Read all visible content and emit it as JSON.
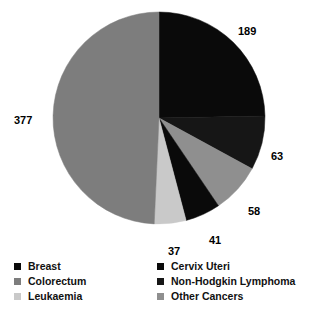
{
  "chart_data": {
    "type": "pie",
    "title": "",
    "subtitle": "",
    "xlabel": "",
    "ylabel": "",
    "legend_position": "bottom",
    "grid": false,
    "total": 765,
    "start_angle_deg": 0,
    "direction": "clockwise",
    "categories": [
      "Breast",
      "Non-Hodgkin Lymphoma",
      "Other Cancers",
      "Cervix Uteri",
      "Leukaemia",
      "Colorectum"
    ],
    "values": [
      189,
      63,
      58,
      41,
      37,
      377
    ],
    "slices": [
      {
        "label": "Breast",
        "value": 189,
        "value_text": "189",
        "color": "#0a0a0a"
      },
      {
        "label": "Non-Hodgkin Lymphoma",
        "value": 63,
        "value_text": "63",
        "color": "#161616"
      },
      {
        "label": "Other Cancers",
        "value": 58,
        "value_text": "58",
        "color": "#8f8f8f"
      },
      {
        "label": "Cervix Uteri",
        "value": 41,
        "value_text": "41",
        "color": "#0a0a0a"
      },
      {
        "label": "Leukaemia",
        "value": 37,
        "value_text": "37",
        "color": "#c9c9c9"
      },
      {
        "label": "Colorectum",
        "value": 377,
        "value_text": "377",
        "color": "#7d7d7d"
      }
    ],
    "data_labels": [
      {
        "name": "breast",
        "text": "189",
        "x": 238,
        "y": 25
      },
      {
        "name": "non-hodgkin-lymphoma",
        "text": "63",
        "x": 271,
        "y": 150
      },
      {
        "name": "other-cancers",
        "text": "58",
        "x": 248,
        "y": 205
      },
      {
        "name": "cervix-uteri",
        "text": "41",
        "x": 209,
        "y": 234
      },
      {
        "name": "leukaemia",
        "text": "37",
        "x": 168,
        "y": 245
      },
      {
        "name": "colorectum",
        "text": "377",
        "x": 14,
        "y": 114
      }
    ]
  },
  "legend": {
    "left_column": [
      {
        "label": "Breast",
        "color": "#0a0a0a"
      },
      {
        "label": "Colorectum",
        "color": "#7d7d7d"
      },
      {
        "label": "Leukaemia",
        "color": "#c9c9c9"
      }
    ],
    "right_column": [
      {
        "label": "Cervix Uteri",
        "color": "#0a0a0a"
      },
      {
        "label": "Non-Hodgkin Lymphoma",
        "color": "#161616"
      },
      {
        "label": "Other Cancers",
        "color": "#8f8f8f"
      }
    ]
  }
}
